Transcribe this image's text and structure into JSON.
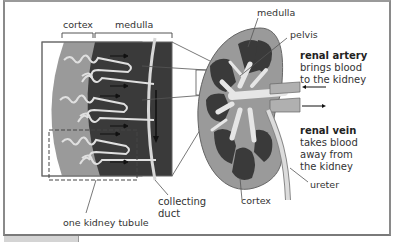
{
  "diagram": {
    "type": "anatomical-diagram",
    "subject": "kidney",
    "labels": {
      "cortex_inset": "cortex",
      "medulla_inset": "medulla",
      "collecting_duct_line1": "collecting",
      "collecting_duct_line2": "duct",
      "kidney_tubule": "one kidney tubule",
      "medulla": "medulla",
      "pelvis": "pelvis",
      "cortex": "cortex",
      "ureter": "ureter"
    },
    "renal_artery": {
      "title": "renal artery",
      "line1": "brings blood",
      "line2": "to the kidney"
    },
    "renal_vein": {
      "title": "renal vein",
      "line1": "takes blood",
      "line2": "away from",
      "line3": "the kidney"
    },
    "colors": {
      "cortex": "#9a9a9a",
      "medulla": "#3a3a3a",
      "vessels": "#e8e8e8",
      "outline": "#555555"
    }
  }
}
